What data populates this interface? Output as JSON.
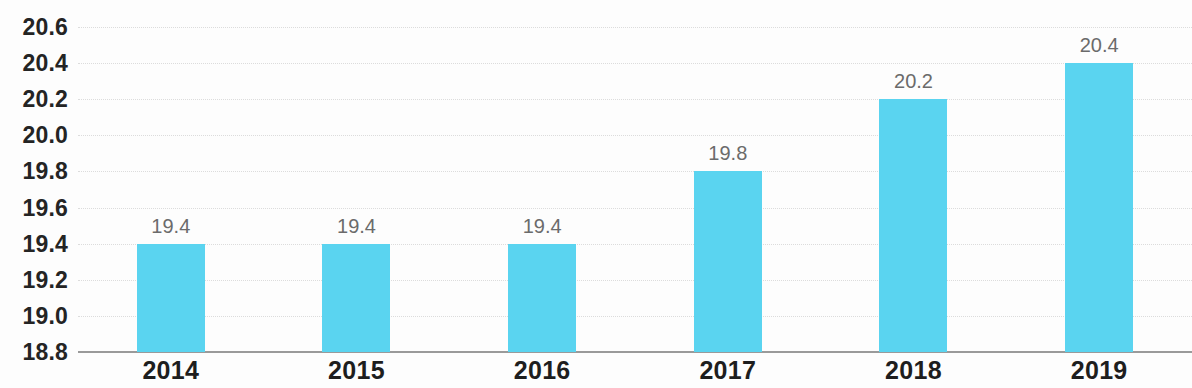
{
  "chart_data": {
    "type": "bar",
    "title": "",
    "subtitle": "",
    "xlabel": "",
    "ylabel": "",
    "categories": [
      "2014",
      "2015",
      "2016",
      "2017",
      "2018",
      "2019"
    ],
    "values": [
      19.4,
      19.4,
      19.4,
      19.8,
      20.2,
      20.4
    ],
    "data_labels": [
      "19.4",
      "19.4",
      "19.4",
      "19.8",
      "20.2",
      "20.4"
    ],
    "ylim": [
      18.8,
      20.6
    ],
    "ytick_step": 0.2,
    "ytick_labels": [
      "20.6",
      "20.4",
      "20.2",
      "20.0",
      "19.8",
      "19.6",
      "19.4",
      "19.2",
      "19.0",
      "18.8"
    ],
    "ytick_values": [
      20.6,
      20.4,
      20.2,
      20.0,
      19.8,
      19.6,
      19.4,
      19.2,
      19.0,
      18.8
    ],
    "grid": true,
    "grid_style": "dotted",
    "legend": false,
    "legend_position": "none",
    "annotations": [],
    "colors": {
      "bar": "#5ad4f0",
      "background": "#fdfdfd",
      "gridline": "#dcdcdc",
      "axis_line": "#9a9a9a",
      "ytick_text": "#242424",
      "xtick_text": "#1e1e1e",
      "data_label_text": "#6b6b6b"
    }
  }
}
